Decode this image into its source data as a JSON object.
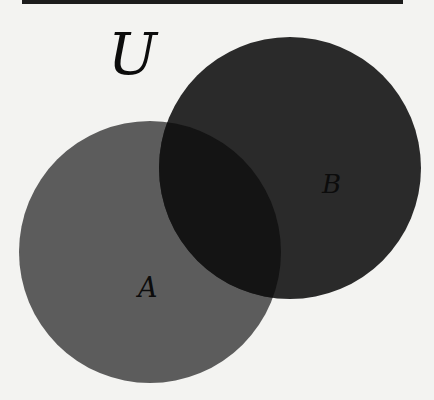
{
  "diagram": {
    "type": "venn",
    "universe_label": "U",
    "sets": [
      {
        "label": "A",
        "fill": "#5c5c5c",
        "cx": 150,
        "cy": 252,
        "r": 131
      },
      {
        "label": "B",
        "fill": "#2a2a2a",
        "cx": 290,
        "cy": 168,
        "r": 131
      }
    ],
    "intersection_fill": "#141414",
    "background": "#f3f3f1",
    "top_rule_color": "#1c1c1c"
  }
}
